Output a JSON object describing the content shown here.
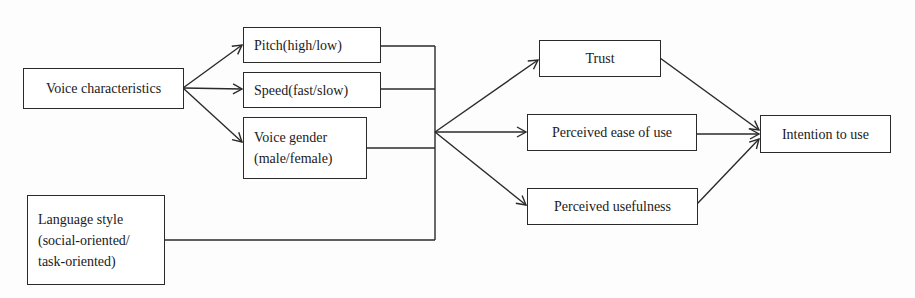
{
  "diagram": {
    "type": "research-model-flowchart",
    "nodes": {
      "voice_characteristics": {
        "label": "Voice characteristics"
      },
      "pitch": {
        "label": "Pitch(high/low)"
      },
      "speed": {
        "label": "Speed(fast/slow)"
      },
      "voice_gender": {
        "line1": "Voice gender",
        "line2": "(male/female)"
      },
      "language_style": {
        "line1": "Language style",
        "line2": "(social-oriented/",
        "line3": "task-oriented)"
      },
      "trust": {
        "label": "Trust"
      },
      "ease_of_use": {
        "label": "Perceived ease of use"
      },
      "usefulness": {
        "label": "Perceived usefulness"
      },
      "intention": {
        "label": "Intention to use"
      }
    },
    "edges": [
      {
        "from": "Voice characteristics",
        "to": "Pitch(high/low)"
      },
      {
        "from": "Voice characteristics",
        "to": "Speed(fast/slow)"
      },
      {
        "from": "Voice characteristics",
        "to": "Voice gender (male/female)"
      },
      {
        "from": "Pitch / Speed / Voice gender / Language style (merged)",
        "to": "Trust"
      },
      {
        "from": "Pitch / Speed / Voice gender / Language style (merged)",
        "to": "Perceived ease of use"
      },
      {
        "from": "Pitch / Speed / Voice gender / Language style (merged)",
        "to": "Perceived usefulness"
      },
      {
        "from": "Trust",
        "to": "Intention to use"
      },
      {
        "from": "Perceived ease of use",
        "to": "Intention to use"
      },
      {
        "from": "Perceived usefulness",
        "to": "Intention to use"
      }
    ],
    "colors": {
      "line": "#2a2a2a",
      "text": "#1a1a1a",
      "background": "#fdfdfd"
    }
  }
}
